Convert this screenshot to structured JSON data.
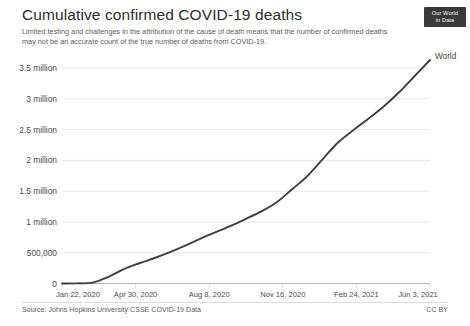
{
  "header": {
    "title": "Cumulative confirmed COVID-19 deaths",
    "subtitle": "Limited testing and challenges in the attribution of the cause of death means that the number of confirmed deaths may not be an accurate count of the true number of deaths from COVID-19.",
    "logo_line1": "Our World",
    "logo_line2": "in Data"
  },
  "footer": {
    "source": "Source: Johns Hopkins University CSSE COVID-19 Data",
    "license": "CC BY"
  },
  "colors": {
    "line": "#3f3f3f",
    "gridline": "#dcdcdc",
    "axis": "#b4b4b4",
    "text": "#4a4a4a",
    "background": "#ffffff",
    "logo_background": "#3a3a3a"
  },
  "chart_data": {
    "type": "line",
    "title": "Cumulative confirmed COVID-19 deaths",
    "subtitle": "Limited testing and challenges in the attribution of the cause of death means that the number of confirmed deaths may not be an accurate count of the true number of deaths from COVID-19.",
    "xlabel": "",
    "ylabel": "",
    "grid": true,
    "legend_position": "line-end-label",
    "ylim": [
      0,
      3500000
    ],
    "ytick_labels": [
      "0",
      "500,000",
      "1 million",
      "1.5 million",
      "2 million",
      "2.5 million",
      "3 million",
      "3.5 million"
    ],
    "ytick_values": [
      0,
      500000,
      1000000,
      1500000,
      2000000,
      2500000,
      3000000,
      3500000
    ],
    "xtick_labels": [
      "Jan 22, 2020",
      "Apr 30, 2020",
      "Aug 8, 2020",
      "Nov 16, 2020",
      "Feb 24, 2021",
      "Jun 3, 2021"
    ],
    "series": [
      {
        "name": "World",
        "x": [
          "Jan 22, 2020",
          "Feb 21, 2020",
          "Mar 22, 2020",
          "Apr 11, 2020",
          "Apr 30, 2020",
          "May 20, 2020",
          "Jun 9, 2020",
          "Jun 29, 2020",
          "Jul 19, 2020",
          "Aug 8, 2020",
          "Aug 28, 2020",
          "Sep 17, 2020",
          "Oct 7, 2020",
          "Oct 27, 2020",
          "Nov 16, 2020",
          "Dec 6, 2020",
          "Dec 26, 2020",
          "Jan 15, 2021",
          "Feb 4, 2021",
          "Feb 24, 2021",
          "Mar 16, 2021",
          "Apr 5, 2021",
          "Apr 25, 2021",
          "May 15, 2021",
          "Jun 3, 2021"
        ],
        "values": [
          17,
          2400,
          14000,
          105000,
          230000,
          325000,
          410000,
          505000,
          610000,
          725000,
          830000,
          935000,
          1050000,
          1170000,
          1320000,
          1530000,
          1745000,
          2020000,
          2290000,
          2490000,
          2680000,
          2880000,
          3110000,
          3370000,
          3630000
        ],
        "end_label": "World",
        "end_value": 3630000
      }
    ]
  }
}
